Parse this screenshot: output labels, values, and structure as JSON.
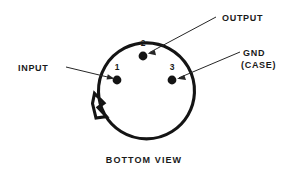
{
  "diagram": {
    "title": "BOTTOM VIEW",
    "package_outline": {
      "shape": "circle-with-index-tab",
      "center_x": 139.5,
      "center_y": 81.5,
      "radius": 48,
      "tab_position": "lower-left"
    },
    "pins": [
      {
        "number": "1",
        "label": "INPUT",
        "dot_x": 117,
        "dot_y": 80,
        "num_x": 117,
        "num_y": 70,
        "label_x": 18,
        "label_y": 71,
        "leader_from_x": 66,
        "leader_from_y": 67,
        "leader_to_x": 112,
        "leader_to_y": 78
      },
      {
        "number": "2",
        "label": "OUTPUT",
        "dot_x": 143,
        "dot_y": 56,
        "num_x": 143,
        "num_y": 46,
        "label_x": 222,
        "label_y": 21,
        "leader_from_x": 216,
        "leader_from_y": 17,
        "leader_to_x": 148,
        "leader_to_y": 53
      },
      {
        "number": "3",
        "label": "GND",
        "label_line2": "(CASE)",
        "dot_x": 172,
        "dot_y": 80,
        "num_x": 172,
        "num_y": 70,
        "label_x": 243,
        "label_y": 56,
        "label2_x": 243,
        "label2_y": 68,
        "leader_from_x": 240,
        "leader_from_y": 52,
        "leader_to_x": 178,
        "leader_to_y": 78
      }
    ],
    "caption_x": 144,
    "caption_y": 163,
    "colors": {
      "background": "#ffffff",
      "outline": "#141414",
      "text": "#1a1a1a",
      "leader": "#262626"
    }
  }
}
